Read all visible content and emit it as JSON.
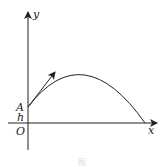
{
  "diagram": {
    "type": "projectile-trajectory",
    "labels": {
      "y_axis": "y",
      "x_axis": "x",
      "origin": "O",
      "launch_point": "A",
      "height": "h"
    },
    "caption": "图",
    "colors": {
      "stroke": "#222222",
      "background": "#ffffff"
    }
  }
}
